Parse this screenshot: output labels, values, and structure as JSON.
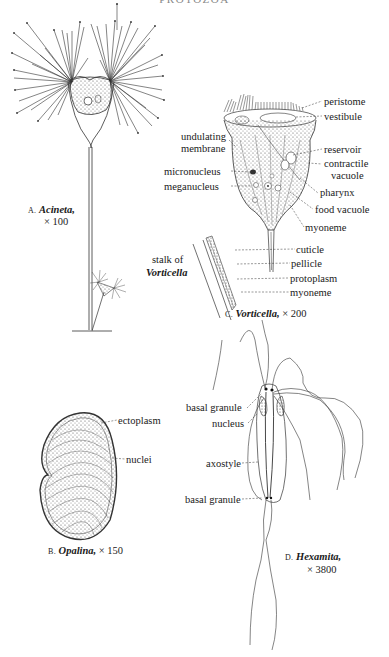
{
  "page": {
    "running_header": "PROTOZOA"
  },
  "figures": {
    "acineta": {
      "letter": "A.",
      "name": "Acineta,",
      "magnification": "× 100"
    },
    "opalina": {
      "letter": "B.",
      "name": "Opalina,",
      "magnification": "× 150",
      "labels": [
        "ectoplasm",
        "nuclei"
      ]
    },
    "vorticella": {
      "letter": "C.",
      "name": "Vorticella,",
      "magnification": "× 200",
      "labels_right": [
        "peristome",
        "vestibule",
        "reservoir",
        "contractile",
        "vacuole",
        "pharynx",
        "food vacuole",
        "myoneme",
        "cuticle",
        "pellicle",
        "protoplasm",
        "myoneme"
      ],
      "labels_left": [
        "undulating",
        "membrane",
        "micronucleus",
        "meganucleus"
      ],
      "stalk_label_line1": "stalk of",
      "stalk_label_line2": "Vorticella"
    },
    "hexamita": {
      "letter": "D.",
      "name": "Hexamita,",
      "magnification": "× 3800",
      "labels": [
        "basal granule",
        "nucleus",
        "axostyle",
        "basal granule"
      ]
    }
  },
  "colors": {
    "ink": "#1a1a1a",
    "stipple": "#555555",
    "paper": "#ffffff"
  }
}
